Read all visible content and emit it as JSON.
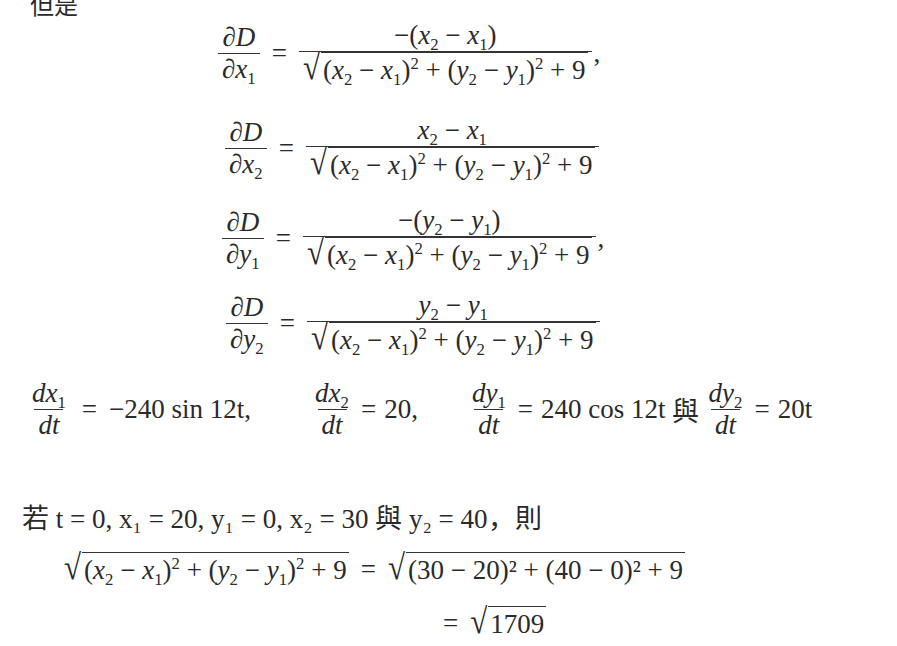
{
  "header_fragment": "但是",
  "partials": [
    {
      "lhs_num": "∂D",
      "lhs_den_var": "x",
      "lhs_den_sub": "1",
      "numerator": "−(x₂ − x₁)",
      "trailing": ","
    },
    {
      "lhs_num": "∂D",
      "lhs_den_var": "x",
      "lhs_den_sub": "2",
      "numerator": "x₂ − x₁",
      "trailing": ""
    },
    {
      "lhs_num": "∂D",
      "lhs_den_var": "y",
      "lhs_den_sub": "1",
      "numerator": "−(y₂ − y₁)",
      "trailing": ","
    },
    {
      "lhs_num": "∂D",
      "lhs_den_var": "y",
      "lhs_den_sub": "2",
      "numerator": "y₂ − y₁",
      "trailing": ""
    }
  ],
  "common_denominator": "√((x₂ − x₁)² + (y₂ − y₁)² + 9)",
  "derivatives": {
    "dx1dt": "−240 sin 12t,",
    "dx2dt": "20,",
    "dy1dt": "240 cos 12t",
    "connector": "與",
    "dy2dt": "20t"
  },
  "condition_line": {
    "prefix": "若",
    "text": "t = 0, x₁ = 20, y₁ = 0, x₂ = 30",
    "connector": "與",
    "tail": "y₂ = 40",
    "suffix": "，則"
  },
  "evaluation": {
    "lhs": "√((x₂ − x₁)² + (y₂ − y₁)² + 9)",
    "rhs1": "√((30 − 20)² + (40 − 0)² + 9)",
    "rhs2": "√1709",
    "rhs1_inner": "(30 − 20)² + (40 − 0)² + 9",
    "rhs2_inner": "1709"
  }
}
